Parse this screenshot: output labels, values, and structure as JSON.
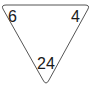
{
  "triangle": {
    "top_left": "6",
    "top_right": "4",
    "bottom": "24",
    "stroke_color": "#555555",
    "fill_color": "#ffffff"
  }
}
